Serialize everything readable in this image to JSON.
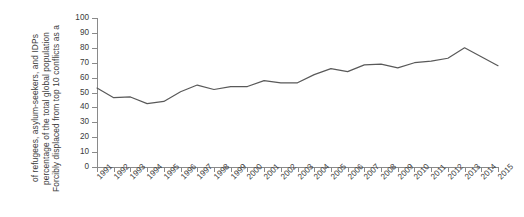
{
  "chart_data": {
    "type": "line",
    "title": "",
    "subtitle": "",
    "xlabel": "",
    "ylabel": "Forcibly displaced from top 10 conflicts as a percentage of the total global population of refugees, asylum-seekers, and IDPs",
    "ylabel_lines": [
      "Forcibly displaced from top 10 conflicts as a",
      "percentage of the total global population",
      "of refugees, asylum-seekers, and IDPs"
    ],
    "categories": [
      "1991",
      "1992",
      "1993",
      "1994",
      "1995",
      "1996",
      "1997",
      "1998",
      "1999",
      "2000",
      "2001",
      "2002",
      "2003",
      "2004",
      "2005",
      "2006",
      "2007",
      "2008",
      "2009",
      "2010",
      "2011",
      "2012",
      "2013",
      "2014",
      "2015"
    ],
    "values": [
      53,
      46.5,
      47,
      42.5,
      44,
      50.5,
      55,
      52,
      54,
      54,
      58,
      56.5,
      56.5,
      62,
      66,
      64,
      68.5,
      69,
      66.5,
      70,
      71,
      73,
      80,
      74,
      68
    ],
    "ylim": [
      0,
      100
    ],
    "yticks": [
      0,
      10,
      20,
      30,
      40,
      50,
      60,
      70,
      80,
      90,
      100
    ],
    "ytick_labels": [
      "0",
      "10",
      "20",
      "30",
      "40",
      "50",
      "60",
      "70",
      "80",
      "90",
      "100"
    ],
    "xlim": [
      "1991",
      "2015"
    ],
    "grid": false,
    "legend": false,
    "legend_position": "none",
    "series": [
      {
        "name": "Forcibly displaced share",
        "color": "#595959",
        "values": [
          53,
          46.5,
          47,
          42.5,
          44,
          50.5,
          55,
          52,
          54,
          54,
          58,
          56.5,
          56.5,
          62,
          66,
          64,
          68.5,
          69,
          66.5,
          70,
          71,
          73,
          80,
          74,
          68
        ]
      }
    ],
    "annotations": []
  },
  "style": {
    "axis_color": "#8a8a8a",
    "line_color": "#595959",
    "text_color": "#3b3b3b",
    "background": "#ffffff"
  }
}
